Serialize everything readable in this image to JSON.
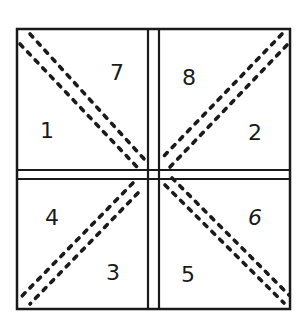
{
  "diagram": {
    "type": "quilt-block-sewing-order",
    "stroke_color": "#1a1a1a",
    "background": "#ffffff",
    "panels": [
      {
        "id": "top-left",
        "numbers": [
          {
            "label": "7",
            "x": 110,
            "y": 80
          },
          {
            "label": "1",
            "x": 40,
            "y": 138
          }
        ]
      },
      {
        "id": "top-right",
        "numbers": [
          {
            "label": "8",
            "x": 190,
            "y": 80
          },
          {
            "label": "2",
            "x": 256,
            "y": 140
          }
        ]
      },
      {
        "id": "bottom-left",
        "numbers": [
          {
            "label": "4",
            "x": 55,
            "y": 222
          },
          {
            "label": "3",
            "x": 113,
            "y": 278
          }
        ]
      },
      {
        "id": "bottom-right",
        "numbers": [
          {
            "label": "6",
            "x": 257,
            "y": 222
          },
          {
            "label": "5",
            "x": 188,
            "y": 280
          }
        ]
      }
    ],
    "diagonals": [
      "top-left to center (double dashed)",
      "top-right to center (double dashed)",
      "bottom-left to center (double dashed)",
      "bottom-right to center (double dashed)"
    ]
  }
}
